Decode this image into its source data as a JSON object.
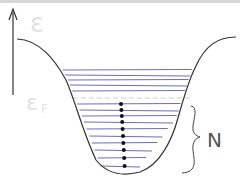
{
  "diagram": {
    "axis_label": "ε",
    "fermi_label": "ε",
    "fermi_subscript": "F",
    "count_label": "N",
    "colors": {
      "well": "#333333",
      "levels": "#6a6ec0",
      "fermi_line": "#cfcfcf",
      "dots": "#111111",
      "axis": "#333333",
      "faint_labels": "#e2e2e2"
    },
    "levels_above_fermi": 5,
    "levels_below_fermi": 10,
    "occupied_electrons": 10
  }
}
